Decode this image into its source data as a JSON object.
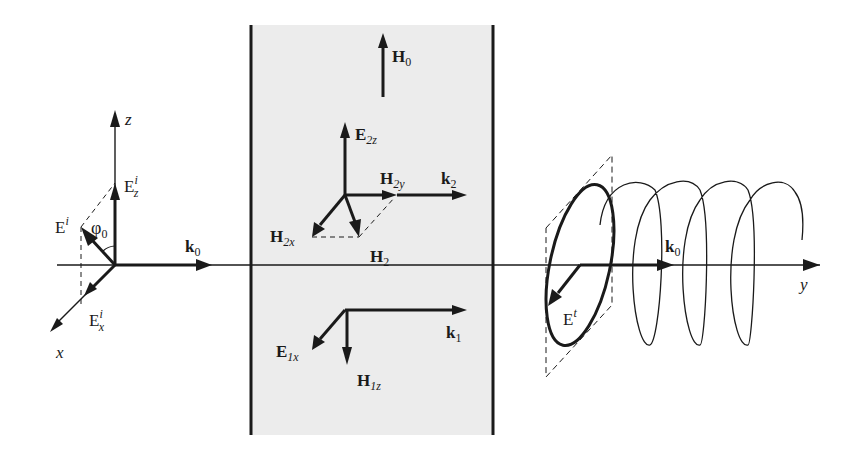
{
  "diagram": {
    "slab_fill": "#ececec",
    "line_color": "#1a1a1a",
    "incident": {
      "axis_z": "z",
      "axis_x": "x",
      "E_i": "E",
      "E_i_sup": "i",
      "E_z": "E",
      "E_z_sub": "z",
      "E_z_sup": "i",
      "E_x": "E",
      "E_x_sub": "x",
      "E_x_sup": "i",
      "phi": "φ",
      "phi_sub": "0",
      "k0": "k",
      "k0_sub": "0"
    },
    "slab": {
      "H0": "H",
      "H0_sub": "0",
      "E2z": "E",
      "E2z_sub": "2z",
      "H2y": "H",
      "H2y_sub": "2y",
      "k2": "k",
      "k2_sub": "2",
      "H2x": "H",
      "H2x_sub": "2x",
      "H2": "H",
      "H2_sub": "2",
      "k1": "k",
      "k1_sub": "1",
      "E1x": "E",
      "E1x_sub": "1x",
      "H1z": "H",
      "H1z_sub": "1z"
    },
    "transmitted": {
      "E_t": "E",
      "E_t_sup": "t",
      "k0": "k",
      "k0_sub": "0",
      "axis_y": "y"
    }
  }
}
